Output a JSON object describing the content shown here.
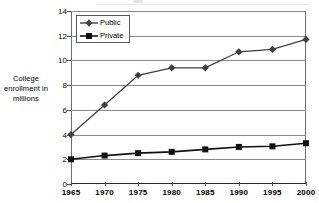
{
  "chart_data": {
    "type": "line",
    "title": "",
    "xlabel": "",
    "ylabel": "College enrollment in millions",
    "ylabel_lines": [
      "College",
      "enrollment in",
      "millions"
    ],
    "categories": [
      "1965",
      "1970",
      "1975",
      "1980",
      "1985",
      "1990",
      "1995",
      "2000"
    ],
    "x": [
      1965,
      1970,
      1975,
      1980,
      1985,
      1990,
      1995,
      2000
    ],
    "series": [
      {
        "name": "Public",
        "marker": "diamond",
        "color": "#3f3f3f",
        "values": [
          4.0,
          6.4,
          8.8,
          9.4,
          9.4,
          10.7,
          10.9,
          11.7
        ]
      },
      {
        "name": "Private",
        "marker": "square",
        "color": "#111111",
        "values": [
          2.0,
          2.3,
          2.5,
          2.6,
          2.8,
          3.0,
          3.05,
          3.3
        ]
      }
    ],
    "ylim": [
      0,
      14
    ],
    "yticks": [
      0,
      2,
      4,
      6,
      8,
      10,
      12,
      14
    ],
    "ytick_labels": [
      "0",
      "2",
      "4",
      "6",
      "8",
      "10",
      "12",
      "14"
    ],
    "grid": true,
    "grid_axis": "y",
    "legend_position": "top-left",
    "legend_entries": [
      "Public",
      "Private"
    ],
    "gridline_color": "#8a8a8a",
    "axis_color": "#2a2a2a",
    "background": "#ffffff"
  }
}
